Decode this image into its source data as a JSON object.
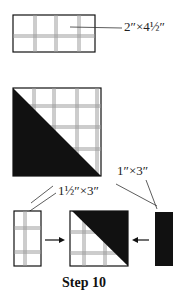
{
  "diagram": {
    "caption": "Step 10",
    "labels": {
      "top_strip": "2″×4½″",
      "dark_strip": "1″×3″",
      "plaid_strip": "1½″×3″"
    },
    "colors": {
      "ink": "#111111",
      "plaid_line": "#9a9a9a",
      "background": "#ffffff"
    },
    "pieces": [
      {
        "id": "plaid-rectangle",
        "fabric": "plaid"
      },
      {
        "id": "half-square-triangle",
        "fabric": "plaid+dark"
      },
      {
        "id": "small-plaid-rectangle",
        "fabric": "plaid"
      },
      {
        "id": "rotated-half-square-triangle",
        "fabric": "plaid+dark"
      },
      {
        "id": "dark-strip",
        "fabric": "dark"
      }
    ]
  }
}
